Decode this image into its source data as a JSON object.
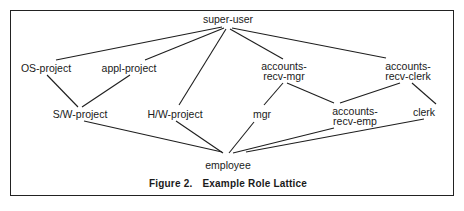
{
  "diagram": {
    "type": "role-lattice",
    "caption": {
      "figure_label": "Figure 2.",
      "title": "Example Role Lattice"
    },
    "nodes": [
      {
        "id": "super-user",
        "lines": [
          "super-user"
        ],
        "x": 228,
        "y": 14
      },
      {
        "id": "OS-project",
        "lines": [
          "OS-project"
        ],
        "x": 46,
        "y": 63
      },
      {
        "id": "appl-project",
        "lines": [
          "appl-project"
        ],
        "x": 129,
        "y": 63
      },
      {
        "id": "accounts-recv-mgr",
        "lines": [
          "accounts-",
          "recv-mgr"
        ],
        "x": 284,
        "y": 61
      },
      {
        "id": "accounts-recv-clerk",
        "lines": [
          "accounts-",
          "recv-clerk"
        ],
        "x": 408,
        "y": 61
      },
      {
        "id": "S/W-project",
        "lines": [
          "S/W-project"
        ],
        "x": 80,
        "y": 109
      },
      {
        "id": "H/W-project",
        "lines": [
          "H/W-project"
        ],
        "x": 175,
        "y": 109
      },
      {
        "id": "mgr",
        "lines": [
          "mgr"
        ],
        "x": 262,
        "y": 109
      },
      {
        "id": "accounts-recv-emp",
        "lines": [
          "accounts-",
          "recv-emp"
        ],
        "x": 355,
        "y": 106
      },
      {
        "id": "clerk",
        "lines": [
          "clerk"
        ],
        "x": 424,
        "y": 107
      },
      {
        "id": "employee",
        "lines": [
          "employee"
        ],
        "x": 228,
        "y": 160
      }
    ],
    "edges": [
      {
        "from": "super-user",
        "to": "OS-project",
        "x1": 222,
        "y1": 27,
        "x2": 56,
        "y2": 60
      },
      {
        "from": "super-user",
        "to": "appl-project",
        "x1": 224,
        "y1": 28,
        "x2": 145,
        "y2": 60
      },
      {
        "from": "super-user",
        "to": "H/W-project",
        "x1": 226,
        "y1": 29,
        "x2": 179,
        "y2": 105
      },
      {
        "from": "super-user",
        "to": "accounts-recv-mgr",
        "x1": 230,
        "y1": 29,
        "x2": 283,
        "y2": 59
      },
      {
        "from": "super-user",
        "to": "accounts-recv-clerk",
        "x1": 232,
        "y1": 28,
        "x2": 386,
        "y2": 58
      },
      {
        "from": "OS-project",
        "to": "S/W-project",
        "x1": 47,
        "y1": 75,
        "x2": 78,
        "y2": 107
      },
      {
        "from": "appl-project",
        "to": "S/W-project",
        "x1": 130,
        "y1": 75,
        "x2": 82,
        "y2": 107
      },
      {
        "from": "accounts-recv-mgr",
        "to": "mgr",
        "x1": 283,
        "y1": 83,
        "x2": 264,
        "y2": 105
      },
      {
        "from": "accounts-recv-mgr",
        "to": "accounts-recv-emp",
        "x1": 287,
        "y1": 83,
        "x2": 334,
        "y2": 103
      },
      {
        "from": "accounts-recv-clerk",
        "to": "accounts-recv-emp",
        "x1": 400,
        "y1": 83,
        "x2": 340,
        "y2": 103
      },
      {
        "from": "accounts-recv-clerk",
        "to": "clerk",
        "x1": 412,
        "y1": 83,
        "x2": 436,
        "y2": 104
      },
      {
        "from": "S/W-project",
        "to": "employee",
        "x1": 84,
        "y1": 121,
        "x2": 222,
        "y2": 152
      },
      {
        "from": "H/W-project",
        "to": "employee",
        "x1": 176,
        "y1": 121,
        "x2": 223,
        "y2": 153
      },
      {
        "from": "mgr",
        "to": "employee",
        "x1": 254,
        "y1": 122,
        "x2": 229,
        "y2": 153
      },
      {
        "from": "accounts-recv-emp",
        "to": "employee",
        "x1": 334,
        "y1": 128,
        "x2": 233,
        "y2": 153
      },
      {
        "from": "clerk",
        "to": "employee",
        "x1": 424,
        "y1": 119,
        "x2": 246,
        "y2": 152
      }
    ]
  },
  "colors": {
    "ink": "#1e1e1e",
    "background": "#ffffff"
  }
}
